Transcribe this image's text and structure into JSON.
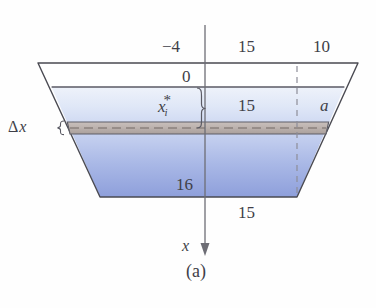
{
  "figure": {
    "caption": "(a)",
    "axis_label": "x",
    "labels": {
      "top_left_depth": "−4",
      "top_width_half": "15",
      "top_slant": "10",
      "water_surface_zero": "0",
      "mid_half_width": "15",
      "side_segment": "a",
      "bottom_depth": "16",
      "bottom_half_width": "15",
      "strip_depth_var_base": "x",
      "strip_depth_var_sub": "i",
      "strip_depth_var_star": "*",
      "strip_thickness_delta": "Δ",
      "strip_thickness_var": "x",
      "brace_left": "{"
    },
    "colors": {
      "water_top": "#e9eef8",
      "water_bottom": "#93a4dd",
      "outline": "#4a4a52",
      "strip_fill": "#bab0ad",
      "axis": "#6d6d75",
      "dashed_guide": "#8e8e98",
      "background": "#fefefe"
    },
    "geometry_note": {
      "tank_top_left_x": 38,
      "tank_top_right_x": 358,
      "tank_top_y": 63,
      "tank_bottom_left_x": 100,
      "tank_bottom_right_x": 297,
      "tank_bottom_y": 197,
      "water_surface_y": 87,
      "strip_top_y": 122,
      "strip_bottom_y": 134,
      "axis_x": 205,
      "axis_top_y": 25,
      "axis_arrow_y": 250,
      "dashed_guide_x": 297
    }
  }
}
